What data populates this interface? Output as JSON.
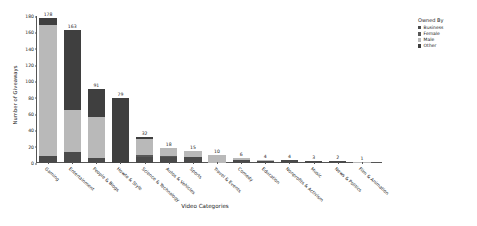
{
  "chart_data": {
    "type": "bar",
    "stacked": true,
    "title": "",
    "xlabel": "Video Categories",
    "ylabel": "Number of Giveaways",
    "ylim": [
      0,
      180
    ],
    "ytick_step": 20,
    "yticks": [
      0,
      20,
      40,
      60,
      80,
      100,
      120,
      140,
      160,
      180
    ],
    "grid": false,
    "legend_title": "Owned By",
    "legend_position": "right",
    "categories": [
      "Gaming",
      "Entertainment",
      "People & Blogs",
      "Howto & Style",
      "Science & Technology",
      "Autos & Vehicles",
      "Sports",
      "Travel & Events",
      "Comedy",
      "Education",
      "Nonprofits & Activism",
      "Music",
      "News & Politics",
      "Film & Animation"
    ],
    "totals": [
      178,
      163,
      91,
      79,
      32,
      18,
      15,
      10,
      6,
      4,
      4,
      3,
      2,
      1
    ],
    "series": [
      {
        "name": "Business",
        "color": "#4a4a4a",
        "values": [
          9,
          13,
          6,
          0,
          7,
          7,
          7,
          0,
          4,
          2,
          4,
          2,
          2,
          0
        ]
      },
      {
        "name": "Female",
        "color": "#585858",
        "values": [
          0,
          0,
          0,
          0,
          3,
          2,
          0,
          0,
          0,
          0,
          0,
          0,
          0,
          0
        ]
      },
      {
        "name": "Male",
        "color": "#b9b9b9",
        "values": [
          160,
          52,
          50,
          0,
          20,
          9,
          8,
          10,
          2,
          2,
          0,
          1,
          0,
          1
        ]
      },
      {
        "name": "Other",
        "color": "#3f3f3f",
        "values": [
          9,
          98,
          35,
          79,
          2,
          0,
          0,
          0,
          0,
          0,
          0,
          0,
          0,
          0
        ]
      }
    ]
  },
  "legend": {
    "title": "Owned By",
    "items": [
      {
        "label": "Business",
        "color": "#4a4a4a"
      },
      {
        "label": "Female",
        "color": "#585858"
      },
      {
        "label": "Male",
        "color": "#b9b9b9"
      },
      {
        "label": "Other",
        "color": "#3f3f3f"
      }
    ]
  },
  "axes": {
    "x_title": "Video Categories",
    "y_title": "Number of Giveaways"
  }
}
